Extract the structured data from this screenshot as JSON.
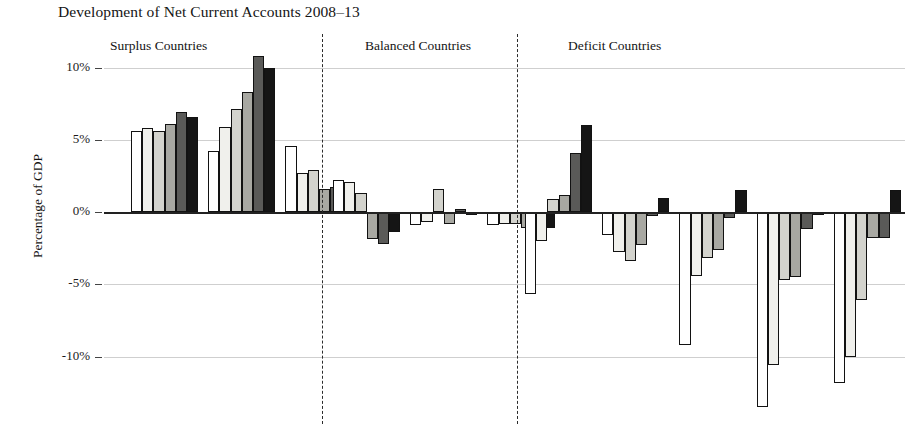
{
  "chart_data": {
    "type": "bar",
    "title": "Development of Net Current Accounts 2008–13",
    "xlabel": "",
    "ylabel": "Percentage of GDP",
    "ylim": [
      -13.5,
      11.5
    ],
    "yticks": [
      10,
      5,
      0,
      -5,
      -10
    ],
    "ytick_labels": [
      "10%",
      "5%",
      "0%",
      "-5%",
      "-10%"
    ],
    "grid": true,
    "legend_position": "none",
    "series": [
      {
        "name": "2008",
        "fill": "white"
      },
      {
        "name": "2009",
        "fill": "very-light-gray"
      },
      {
        "name": "2010",
        "fill": "light-gray"
      },
      {
        "name": "2011",
        "fill": "mid-gray"
      },
      {
        "name": "2012",
        "fill": "dark-gray"
      },
      {
        "name": "2013",
        "fill": "black"
      }
    ],
    "sections": [
      {
        "label": "Surplus Countries",
        "groups": [
          {
            "values": [
              5.6,
              5.8,
              5.6,
              6.1,
              6.9,
              6.6
            ]
          },
          {
            "values": [
              4.2,
              5.9,
              7.1,
              8.3,
              10.8,
              10.0
            ]
          },
          {
            "values": [
              4.6,
              2.7,
              2.9,
              1.6,
              1.7,
              2.0
            ]
          }
        ]
      },
      {
        "label": "Balanced Countries",
        "groups": [
          {
            "values": [
              2.2,
              2.1,
              1.3,
              -1.9,
              -2.2,
              -1.4
            ]
          },
          {
            "values": [
              -0.9,
              -0.7,
              1.6,
              -0.8,
              0.2,
              -0.2
            ]
          },
          {
            "values": [
              -0.9,
              -0.8,
              -0.8,
              -1.1,
              -1.3,
              -1.1
            ]
          }
        ]
      },
      {
        "label": "Deficit Countries",
        "groups": [
          {
            "values": [
              -5.7,
              -2.0,
              0.9,
              1.2,
              4.1,
              6.0
            ]
          },
          {
            "values": [
              -1.6,
              -2.8,
              -3.4,
              -2.3,
              -0.3,
              1.0
            ]
          },
          {
            "values": [
              -9.2,
              -4.4,
              -3.2,
              -2.6,
              -0.4,
              1.5
            ]
          },
          {
            "values": [
              -13.5,
              -10.6,
              -4.7,
              -4.5,
              -1.2,
              -0.2
            ]
          },
          {
            "values": [
              -11.8,
              -10.0,
              -6.1,
              -1.8,
              -1.8,
              1.5
            ]
          }
        ]
      }
    ]
  },
  "axis": {
    "ylabel": "Percentage of GDP"
  },
  "labels": {
    "surplus": "Surplus Countries",
    "balanced": "Balanced Countries",
    "deficit": "Deficit Countries"
  }
}
